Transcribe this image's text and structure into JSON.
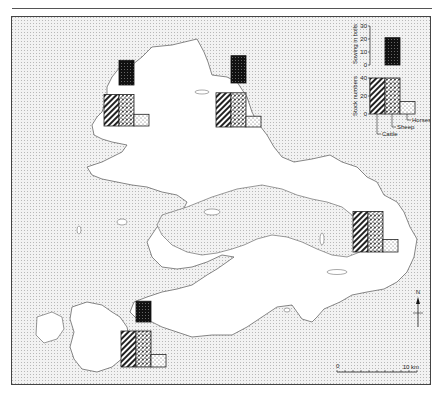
{
  "map": {
    "type": "thematic-map",
    "description": "Island map with bar-chart symbols per district",
    "colors": {
      "sea": "#e8e8e8",
      "land": "#ffffff",
      "coast": "#555555",
      "ink": "#111111"
    }
  },
  "legend": {
    "sowing_axis_label": "Sowing in bolls",
    "sowing_ticks": [
      "30",
      "20",
      "10",
      "0"
    ],
    "stock_axis_label": "Stock numbers",
    "stock_ticks": [
      "40",
      "20",
      "0"
    ],
    "series": [
      {
        "name": "Cattle",
        "pattern": "diagonal-hatch"
      },
      {
        "name": "Sheep",
        "pattern": "dense-stipple"
      },
      {
        "name": "Horses",
        "pattern": "light-stipple"
      }
    ],
    "sample": {
      "sowing": 21,
      "cattle": 40,
      "sheep": 40,
      "horses": 14
    }
  },
  "chart_data": {
    "type": "bar",
    "title": "",
    "units": {
      "sowing": "bolls",
      "stock": "head"
    },
    "sowing_range": [
      0,
      30
    ],
    "stock_range": [
      0,
      40
    ],
    "categories": [
      "North-west",
      "North",
      "East",
      "South-west"
    ],
    "series": [
      {
        "name": "Sowing in bolls",
        "values": [
          19,
          21,
          null,
          16
        ]
      },
      {
        "name": "Cattle",
        "values": [
          35,
          38,
          45,
          40
        ]
      },
      {
        "name": "Sheep",
        "values": [
          35,
          38,
          45,
          40
        ]
      },
      {
        "name": "Horses",
        "values": [
          13,
          12,
          14,
          14
        ]
      }
    ]
  },
  "scale_bar": {
    "start_label": "0",
    "end_label": "10 km"
  },
  "north_arrow": {
    "label": "N"
  }
}
